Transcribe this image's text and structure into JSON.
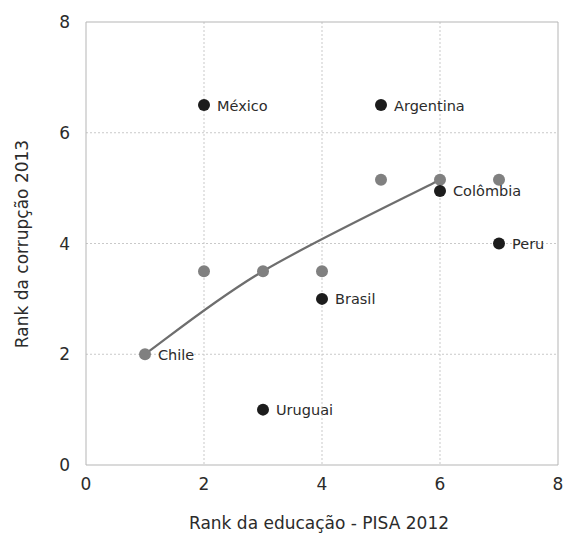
{
  "chart_data": {
    "type": "scatter",
    "title": "",
    "xlabel": "Rank da educação - PISA 2012",
    "ylabel": "Rank da corrupção 2013",
    "xlim": [
      0,
      8
    ],
    "ylim": [
      0,
      8
    ],
    "xticks": [
      0,
      2,
      4,
      6,
      8
    ],
    "yticks": [
      0,
      2,
      4,
      6,
      8
    ],
    "xtick_labels": [
      "0",
      "2",
      "4",
      "6",
      "8"
    ],
    "ytick_labels": [
      "0",
      "2",
      "4",
      "6",
      "8"
    ],
    "grid": true,
    "legend": "none",
    "colors": {
      "labeled_point": "#1c1c1c",
      "unlabeled_point": "#808080",
      "trend_line": "#6e6e6e",
      "grid": "#c9c9c9",
      "frame": "#b5b5b5",
      "text": "#2b2b2b",
      "background": "#ffffff"
    },
    "series": [
      {
        "name": "Países rotulados",
        "color": "#1c1c1c",
        "marker": "circle",
        "points": [
          {
            "label": "México",
            "x": 2,
            "y": 6.5,
            "label_side": "right"
          },
          {
            "label": "Argentina",
            "x": 5,
            "y": 6.5,
            "label_side": "right"
          },
          {
            "label": "Colômbia",
            "x": 6,
            "y": 4.95,
            "label_side": "right"
          },
          {
            "label": "Peru",
            "x": 7,
            "y": 4,
            "label_side": "right"
          },
          {
            "label": "Brasil",
            "x": 4,
            "y": 3,
            "label_side": "right"
          },
          {
            "label": "Chile",
            "x": 1,
            "y": 2,
            "label_side": "right",
            "color": "#808080"
          },
          {
            "label": "Uruguai",
            "x": 3,
            "y": 1,
            "label_side": "right"
          }
        ]
      },
      {
        "name": "Países sem rótulo",
        "color": "#808080",
        "marker": "circle",
        "points": [
          {
            "label": "",
            "x": 2,
            "y": 3.5
          },
          {
            "label": "",
            "x": 3,
            "y": 3.5
          },
          {
            "label": "",
            "x": 4,
            "y": 3.5
          },
          {
            "label": "",
            "x": 5,
            "y": 5.15
          },
          {
            "label": "",
            "x": 6,
            "y": 5.15
          },
          {
            "label": "",
            "x": 7,
            "y": 5.15
          }
        ]
      }
    ],
    "trend_line": {
      "name": "Linha de tendência",
      "color": "#6e6e6e",
      "points": [
        {
          "x": 1,
          "y": 2
        },
        {
          "x": 3,
          "y": 3.5
        },
        {
          "x": 6,
          "y": 5.15
        }
      ]
    }
  }
}
